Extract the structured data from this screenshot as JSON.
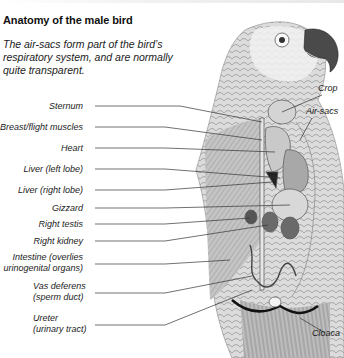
{
  "header": {
    "title": "Anatomy of the male bird",
    "subtitle": "The air-sacs form part of the bird’s respiratory system, and are normally quite transparent."
  },
  "labels_left": [
    {
      "text": "Sternum"
    },
    {
      "text": "Breast/flight muscles"
    },
    {
      "text": "Heart"
    },
    {
      "text": "Liver (left lobe)"
    },
    {
      "text": "Liver (right lobe)"
    },
    {
      "text": "Gizzard"
    },
    {
      "text": "Right testis"
    },
    {
      "text": "Right kidney"
    },
    {
      "line1": "Intestine (overlies",
      "line2": "urinogenital organs)"
    },
    {
      "line1": "Vas deferens",
      "line2": "(sperm duct)"
    },
    {
      "line1": "Ureter",
      "line2": "(urinary tract)"
    }
  ],
  "labels_right": [
    {
      "text": "Crop"
    },
    {
      "text": "Air-sacs"
    },
    {
      "text": "Cloaca"
    }
  ],
  "colors": {
    "background": "#ffffff",
    "text": "#111111",
    "leader_line": "#333333",
    "plumage_light": "#e9e9e9",
    "plumage_mid": "#b8b8b8",
    "plumage_dark": "#6a6a6a",
    "beak": "#4a4a4a"
  }
}
